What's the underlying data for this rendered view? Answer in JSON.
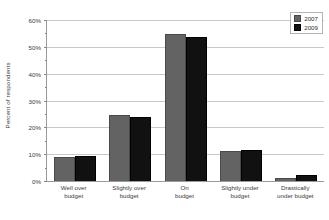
{
  "chart_data": {
    "type": "bar",
    "title": "",
    "xlabel": "",
    "ylabel": "Percent of respondents",
    "ylim": [
      0,
      60
    ],
    "ytick_values": [
      0,
      10,
      20,
      30,
      40,
      50,
      60
    ],
    "ytick_labels": [
      "0%",
      "10%",
      "20%",
      "30%",
      "40%",
      "50%",
      "60%"
    ],
    "grid": true,
    "legend_position": "top-right",
    "categories": [
      "Well over budget",
      "Slightly over budget",
      "On budget",
      "Slightly under budget",
      "Drastically under budget"
    ],
    "category_lines": [
      [
        "Well over",
        "budget"
      ],
      [
        "Slightly over",
        "budget"
      ],
      [
        "On",
        "budget"
      ],
      [
        "Slightly under",
        "budget"
      ],
      [
        "Drastically",
        "under budget"
      ]
    ],
    "series": [
      {
        "name": "2007",
        "color": "#636363",
        "values": [
          9.0,
          24.6,
          54.8,
          11.2,
          1.0
        ]
      },
      {
        "name": "2009",
        "color": "#111111",
        "values": [
          9.4,
          23.7,
          53.5,
          11.4,
          2.1
        ]
      }
    ]
  },
  "legend": {
    "items": [
      {
        "label": "2007"
      },
      {
        "label": "2009"
      }
    ]
  },
  "colors": {
    "series_2007": "#636363",
    "series_2009": "#111111",
    "gridline": "#c8c8c8",
    "axis": "#9a9a9a",
    "background": "#ffffff",
    "text": "#3a3a3a"
  }
}
